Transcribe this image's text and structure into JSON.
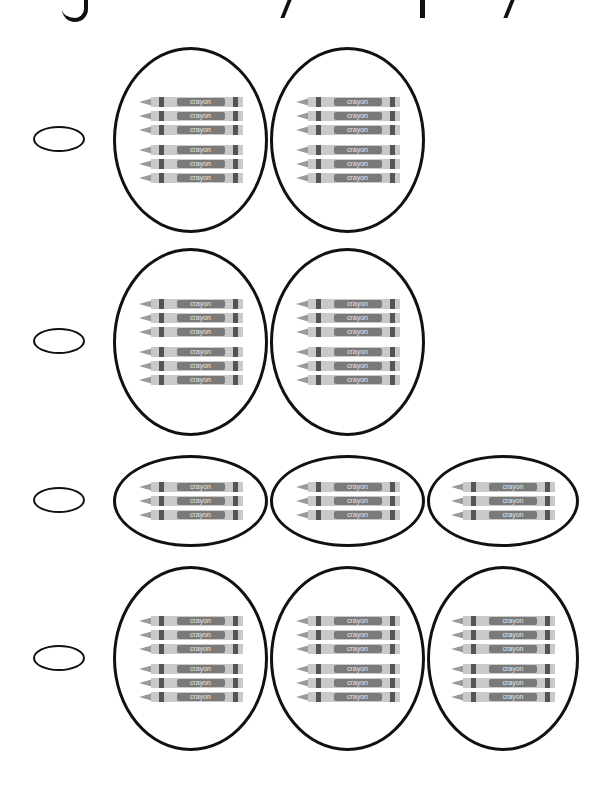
{
  "header": {
    "title_visible": "clipped-title-descenders-only"
  },
  "crayon_label": "crayon",
  "rows": [
    {
      "option_index": 1,
      "groups": 2,
      "crayons_per_group": 6
    },
    {
      "option_index": 2,
      "groups": 2,
      "crayons_per_group": 6
    },
    {
      "option_index": 3,
      "groups": 3,
      "crayons_per_group": 3
    },
    {
      "option_index": 4,
      "groups": 3,
      "crayons_per_group": 6
    }
  ],
  "colors": {
    "outline": "#111111",
    "crayon_body": "#c9c9c9",
    "crayon_band": "#555555",
    "background": "#ffffff"
  }
}
